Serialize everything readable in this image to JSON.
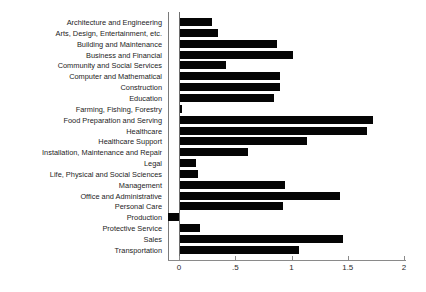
{
  "chart_data": {
    "type": "bar",
    "orientation": "horizontal",
    "title": "",
    "subtitle": "",
    "xlabel": "",
    "ylabel": "",
    "xlim": [
      -0.15,
      2.0
    ],
    "grid": false,
    "legend": null,
    "bar_color": "#050505",
    "axis_color": "#7a7a7a",
    "categories": [
      "Architecture and Engineering",
      "Arts, Design, Entertainment, etc.",
      "Building and Maintenance",
      "Business and Financial",
      "Community and Social Services",
      "Computer and Mathematical",
      "Construction",
      "Education",
      "Farming, Fishing, Forestry",
      "Food Preparation and Serving",
      "Healthcare",
      "Healthcare Support",
      "Installation, Maintenance and Repair",
      "Legal",
      "Life, Physical and Social Sciences",
      "Management",
      "Office and Administrative",
      "Personal Care",
      "Production",
      "Protective Service",
      "Sales",
      "Transportation"
    ],
    "values": [
      0.29,
      0.35,
      0.87,
      1.01,
      0.42,
      0.9,
      0.9,
      0.84,
      0.03,
      1.72,
      1.67,
      1.14,
      0.61,
      0.15,
      0.17,
      0.94,
      1.43,
      0.92,
      -0.1,
      0.19,
      1.46,
      1.07
    ],
    "xticks": [
      0,
      0.5,
      1,
      1.5,
      2
    ],
    "xtick_labels": [
      "0",
      ".5",
      "1",
      "1.5",
      "2"
    ]
  },
  "caption": {
    "text": ""
  }
}
